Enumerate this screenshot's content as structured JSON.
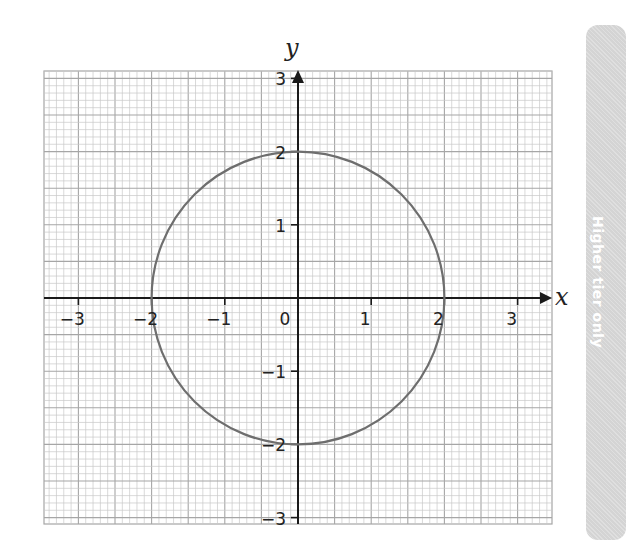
{
  "side_tab": {
    "label": "Higher tier only"
  },
  "chart_data": {
    "type": "line",
    "title": "",
    "xlabel": "x",
    "ylabel": "y",
    "xlim": [
      -3.4,
      3.5
    ],
    "ylim": [
      -3.1,
      3.1
    ],
    "grid": true,
    "grid_minor_step": 0.1,
    "grid_major_step": 0.5,
    "x_ticks": [
      -3,
      -2,
      -1,
      0,
      1,
      2,
      3
    ],
    "x_tick_labels": [
      "−3",
      "−2",
      "−1",
      "0",
      "1",
      "2",
      "3"
    ],
    "y_ticks": [
      -3,
      -2,
      -1,
      1,
      2,
      3
    ],
    "y_tick_labels": [
      "−3",
      "−2",
      "−1",
      "1",
      "2",
      "3"
    ],
    "series": [
      {
        "name": "circle x² + y² = 4",
        "shape": "circle",
        "center": [
          0,
          0
        ],
        "radius": 2,
        "color": "#6e6e6e"
      }
    ],
    "colors": {
      "grid_minor": "#c8c8c8",
      "grid_major": "#a6a6a6",
      "axis": "#1a1a1a",
      "curve": "#6e6e6e"
    }
  }
}
